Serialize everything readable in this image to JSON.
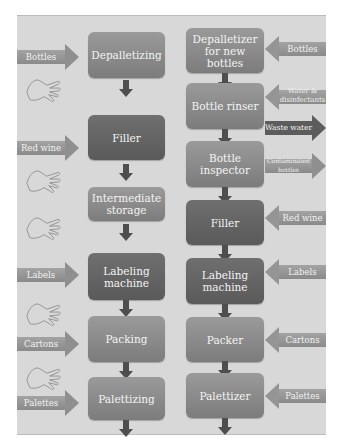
{
  "diagram": {
    "background": "#d8d8d8",
    "left_process": {
      "steps": [
        {
          "label": "Depalletizing"
        },
        {
          "label": "Filler"
        },
        {
          "label": "Intermediate storage"
        },
        {
          "label": "Labeling machine"
        },
        {
          "label": "Packing"
        },
        {
          "label": "Palettizing"
        }
      ],
      "inputs": [
        {
          "label": "Bottles",
          "direction": "in"
        },
        {
          "label": "Red wine",
          "direction": "in"
        },
        {
          "label": "Labels",
          "direction": "in"
        },
        {
          "label": "Cartons",
          "direction": "in"
        },
        {
          "label": "Palettes",
          "direction": "in"
        }
      ],
      "manual_steps_icon": "hand-icon"
    },
    "right_process": {
      "steps": [
        {
          "label": "Depalletizer for new bottles"
        },
        {
          "label": "Bottle rinser"
        },
        {
          "label": "Bottle inspector"
        },
        {
          "label": "Filler"
        },
        {
          "label": "Labeling machine"
        },
        {
          "label": "Packer"
        },
        {
          "label": "Palettizer"
        }
      ],
      "flows": [
        {
          "label": "Bottles",
          "direction": "in"
        },
        {
          "label": "Water & disinfectants",
          "direction": "in"
        },
        {
          "label": "Waste water",
          "direction": "out"
        },
        {
          "label": "Contaminated bottles",
          "direction": "out"
        },
        {
          "label": "Red wine",
          "direction": "in"
        },
        {
          "label": "Labels",
          "direction": "in"
        },
        {
          "label": "Cartons",
          "direction": "in"
        },
        {
          "label": "Palettes",
          "direction": "in"
        }
      ]
    }
  }
}
